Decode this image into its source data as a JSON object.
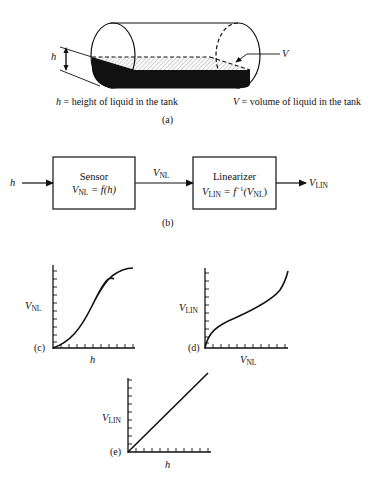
{
  "panel_a": {
    "caption": "(a)",
    "h_marker": "h",
    "v_marker": "V",
    "legend_h_var": "h",
    "legend_h_text": "= height of liquid in the tank",
    "legend_v_var": "V",
    "legend_v_text": "= volume of liquid in the tank"
  },
  "panel_b": {
    "caption": "(b)",
    "input_label": "h",
    "sensor": {
      "title": "Sensor",
      "eq_var": "V",
      "eq_sub": "NL",
      "eq_rhs": "= f(h)"
    },
    "middle_label": {
      "var": "V",
      "sub": "NL"
    },
    "linearizer": {
      "title": "Linearizer",
      "eq_var": "V",
      "eq_sub": "LIN",
      "eq_mid": "= f",
      "eq_sup": "−1",
      "eq_open": "(V",
      "eq_arg_sub": "NL",
      "eq_close": ")"
    },
    "output_label": {
      "var": "V",
      "sub": "LIN"
    }
  },
  "panel_c": {
    "caption": "(c)",
    "ylabel_var": "V",
    "ylabel_sub": "NL",
    "xlabel": "h"
  },
  "panel_d": {
    "caption": "(d)",
    "ylabel_var": "V",
    "ylabel_sub": "LIN",
    "xlabel_var": "V",
    "xlabel_sub": "NL"
  },
  "panel_e": {
    "caption": "(e)",
    "ylabel_var": "V",
    "ylabel_sub": "LIN",
    "xlabel": "h"
  },
  "colors": {
    "ink": "#111111",
    "background": "#ffffff"
  }
}
